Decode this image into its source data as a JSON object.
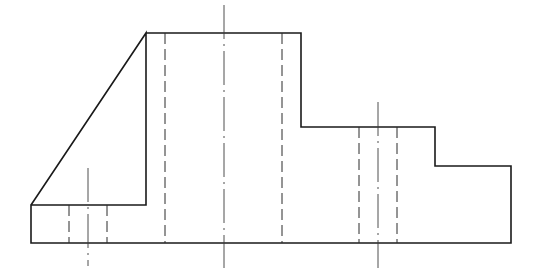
{
  "drawing": {
    "type": "orthographic-front-view",
    "background": "#ffffff",
    "line_color": "#1a1a1a",
    "outline_points": [
      [
        146,
        33
      ],
      [
        301,
        33
      ],
      [
        301,
        127
      ],
      [
        435,
        127
      ],
      [
        435,
        166
      ],
      [
        511,
        166
      ],
      [
        511,
        243
      ],
      [
        31,
        243
      ],
      [
        31,
        205
      ],
      [
        146,
        205
      ],
      [
        146,
        33
      ],
      [
        31,
        205
      ]
    ],
    "hidden_lines": [
      {
        "name": "bore-left-edge",
        "x": 165,
        "y1": 33,
        "y2": 243
      },
      {
        "name": "bore-right-edge",
        "x": 282,
        "y1": 33,
        "y2": 243
      },
      {
        "name": "right-hole-left-edge",
        "x": 359,
        "y1": 127,
        "y2": 243
      },
      {
        "name": "right-hole-right-edge",
        "x": 397,
        "y1": 127,
        "y2": 243
      },
      {
        "name": "left-hole-left-edge",
        "x": 69,
        "y1": 205,
        "y2": 243
      },
      {
        "name": "left-hole-right-edge",
        "x": 107,
        "y1": 205,
        "y2": 243
      }
    ],
    "center_lines": [
      {
        "name": "main-bore-axis",
        "x": 224,
        "y1": 5,
        "y2": 268
      },
      {
        "name": "right-hole-axis",
        "x": 378,
        "y1": 102,
        "y2": 268
      },
      {
        "name": "left-hole-axis",
        "x": 88,
        "y1": 168,
        "y2": 266
      }
    ]
  }
}
